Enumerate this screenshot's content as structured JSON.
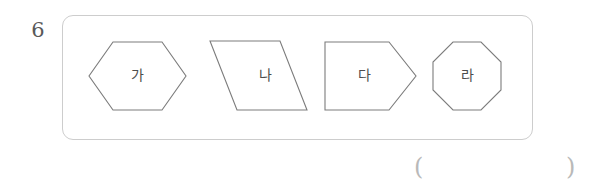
{
  "problem": {
    "number": "6",
    "panel_border_color": "#cdcdcd",
    "shape_stroke_color": "#7c7c7c",
    "label_color": "#4d4d4d"
  },
  "shapes": [
    {
      "name": "hexagon",
      "label": "가",
      "sides": 6,
      "description": "elongated horizontal hexagon"
    },
    {
      "name": "parallelogram",
      "label": "나",
      "sides": 4,
      "description": "right-leaning parallelogram"
    },
    {
      "name": "pentagon",
      "label": "다",
      "sides": 5,
      "description": "home-plate pentagon pointing right"
    },
    {
      "name": "octagon",
      "label": "라",
      "sides": 8,
      "description": "regular octagon"
    }
  ],
  "answer": {
    "open_paren": "(",
    "close_paren": ")",
    "value": ""
  }
}
